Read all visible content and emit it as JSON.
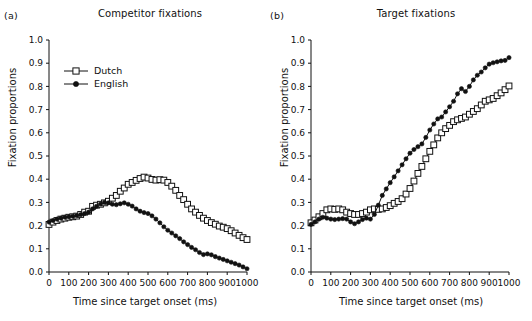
{
  "figure": {
    "background": "#ffffff",
    "line_color": "#111111",
    "panels": [
      {
        "letter": "(a)",
        "title": "Competitor fixations",
        "xlabel": "Time since target onset (ms)",
        "ylabel": "Fixation proportions"
      },
      {
        "letter": "(b)",
        "title": "Target fixations",
        "xlabel": "Time since target onset (ms)",
        "ylabel": "Fixation proportions"
      }
    ],
    "legend": {
      "position": "upper-left-panel-a",
      "entries": [
        {
          "label": "Dutch",
          "marker": "open-square",
          "color": "#111111"
        },
        {
          "label": "English",
          "marker": "filled-circle",
          "color": "#111111"
        }
      ]
    },
    "yticks": [
      "0.0",
      "0.1",
      "0.2",
      "0.3",
      "0.4",
      "0.5",
      "0.6",
      "0.7",
      "0.8",
      "0.9",
      "1.0"
    ],
    "xticks": [
      "0",
      "100",
      "200",
      "300",
      "400",
      "500",
      "600",
      "700",
      "800",
      "900",
      "1000"
    ]
  },
  "chart_data": [
    {
      "type": "line",
      "title": "Competitor fixations",
      "panel": "(a)",
      "xlabel": "Time since target onset (ms)",
      "ylabel": "Fixation proportions",
      "xlim": [
        0,
        1000
      ],
      "ylim": [
        0.0,
        1.0
      ],
      "grid": false,
      "legend_position": "upper left",
      "x": [
        0,
        20,
        40,
        60,
        80,
        100,
        120,
        140,
        160,
        180,
        200,
        220,
        240,
        260,
        280,
        300,
        320,
        340,
        360,
        380,
        400,
        420,
        440,
        460,
        480,
        500,
        520,
        540,
        560,
        580,
        600,
        620,
        640,
        660,
        680,
        700,
        720,
        740,
        760,
        780,
        800,
        820,
        840,
        860,
        880,
        900,
        920,
        940,
        960,
        980,
        1000
      ],
      "series": [
        {
          "name": "Dutch",
          "marker": "open-square",
          "values": [
            0.205,
            0.215,
            0.222,
            0.228,
            0.232,
            0.236,
            0.238,
            0.241,
            0.248,
            0.258,
            0.262,
            0.283,
            0.288,
            0.292,
            0.298,
            0.305,
            0.318,
            0.33,
            0.348,
            0.362,
            0.378,
            0.386,
            0.395,
            0.403,
            0.409,
            0.405,
            0.399,
            0.396,
            0.398,
            0.396,
            0.386,
            0.37,
            0.352,
            0.33,
            0.312,
            0.292,
            0.272,
            0.258,
            0.244,
            0.232,
            0.222,
            0.213,
            0.206,
            0.198,
            0.193,
            0.187,
            0.178,
            0.168,
            0.158,
            0.148,
            0.14
          ]
        },
        {
          "name": "English",
          "marker": "filled-circle",
          "values": [
            0.215,
            0.222,
            0.228,
            0.232,
            0.236,
            0.238,
            0.24,
            0.243,
            0.247,
            0.252,
            0.258,
            0.272,
            0.283,
            0.293,
            0.3,
            0.298,
            0.292,
            0.29,
            0.294,
            0.298,
            0.292,
            0.284,
            0.272,
            0.262,
            0.256,
            0.252,
            0.242,
            0.228,
            0.212,
            0.195,
            0.18,
            0.168,
            0.156,
            0.144,
            0.13,
            0.118,
            0.106,
            0.096,
            0.084,
            0.075,
            0.078,
            0.074,
            0.066,
            0.06,
            0.054,
            0.048,
            0.042,
            0.036,
            0.03,
            0.022,
            0.014
          ]
        }
      ]
    },
    {
      "type": "line",
      "title": "Target fixations",
      "panel": "(b)",
      "xlabel": "Time since target onset (ms)",
      "ylabel": "Fixation proportions",
      "xlim": [
        0,
        1000
      ],
      "ylim": [
        0.0,
        1.0
      ],
      "grid": false,
      "legend_position": "none",
      "x": [
        0,
        20,
        40,
        60,
        80,
        100,
        120,
        140,
        160,
        180,
        200,
        220,
        240,
        260,
        280,
        300,
        320,
        340,
        360,
        380,
        400,
        420,
        440,
        460,
        480,
        500,
        520,
        540,
        560,
        580,
        600,
        620,
        640,
        660,
        680,
        700,
        720,
        740,
        760,
        780,
        800,
        820,
        840,
        860,
        880,
        900,
        920,
        940,
        960,
        980,
        1000
      ],
      "series": [
        {
          "name": "Dutch",
          "marker": "open-square",
          "values": [
            0.212,
            0.224,
            0.238,
            0.252,
            0.268,
            0.272,
            0.27,
            0.272,
            0.268,
            0.258,
            0.252,
            0.248,
            0.248,
            0.252,
            0.258,
            0.268,
            0.272,
            0.27,
            0.272,
            0.278,
            0.286,
            0.296,
            0.304,
            0.316,
            0.336,
            0.36,
            0.392,
            0.425,
            0.455,
            0.488,
            0.52,
            0.548,
            0.578,
            0.6,
            0.618,
            0.632,
            0.648,
            0.656,
            0.662,
            0.668,
            0.68,
            0.692,
            0.704,
            0.72,
            0.736,
            0.742,
            0.748,
            0.76,
            0.772,
            0.786,
            0.802
          ]
        },
        {
          "name": "English",
          "marker": "filled-circle",
          "values": [
            0.205,
            0.216,
            0.228,
            0.236,
            0.232,
            0.228,
            0.226,
            0.228,
            0.23,
            0.228,
            0.216,
            0.208,
            0.216,
            0.226,
            0.232,
            0.228,
            0.248,
            0.288,
            0.33,
            0.358,
            0.385,
            0.41,
            0.436,
            0.462,
            0.488,
            0.512,
            0.528,
            0.54,
            0.552,
            0.58,
            0.612,
            0.638,
            0.66,
            0.668,
            0.69,
            0.712,
            0.736,
            0.768,
            0.79,
            0.778,
            0.8,
            0.828,
            0.848,
            0.862,
            0.88,
            0.896,
            0.902,
            0.906,
            0.91,
            0.912,
            0.924
          ]
        }
      ]
    }
  ]
}
